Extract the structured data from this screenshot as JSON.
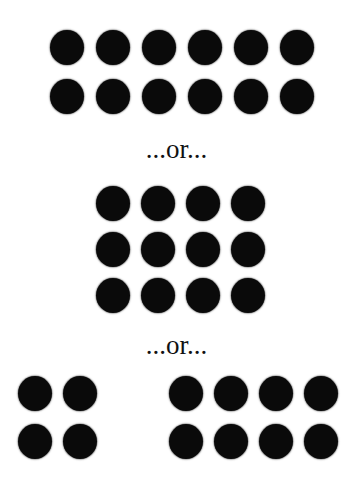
{
  "diagram": {
    "dot_color": "#0a0a0a",
    "dot_diameter": 34,
    "separators": [
      {
        "text": "...or...",
        "center_y": 152
      },
      {
        "text": "...or...",
        "center_y": 348
      }
    ],
    "groups": [
      {
        "name": "arrangement-6x2",
        "label": "6 columns x 2 rows",
        "columns_x": [
          67,
          113,
          159,
          205,
          251,
          297
        ],
        "rows_y": [
          47,
          96
        ]
      },
      {
        "name": "arrangement-4x3",
        "label": "4 columns x 3 rows",
        "columns_x": [
          113,
          158,
          203,
          248
        ],
        "rows_y": [
          203,
          249,
          295
        ]
      },
      {
        "name": "arrangement-2x2-left",
        "label": "2 columns x 2 rows",
        "columns_x": [
          35,
          80
        ],
        "rows_y": [
          393,
          441
        ]
      },
      {
        "name": "arrangement-4x2-right",
        "label": "4 columns x 2 rows",
        "columns_x": [
          186,
          231,
          276,
          321
        ],
        "rows_y": [
          393,
          441
        ]
      }
    ]
  }
}
